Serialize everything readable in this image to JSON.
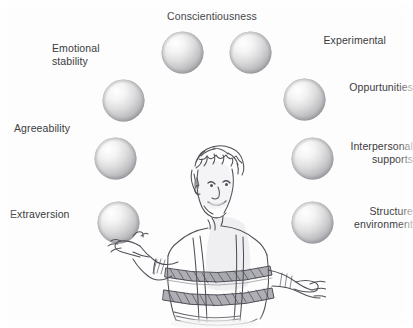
{
  "figure": {
    "canvas": {
      "width": 413,
      "height": 328
    },
    "background_color": "#fdfdfd",
    "text_color": "#3b3b3d",
    "ball_color_light": "#ffffff",
    "ball_color_mid": "#d7d7d9",
    "ball_color_dark": "#9a9a9d",
    "sketch_ink_color": "#4a4a52"
  },
  "labels": {
    "conscientiousness": "Conscientiousness",
    "experimental": "Experimental",
    "opportunities": "Oppurtunities",
    "interpersonal_supports": "Interpersonal\nsupports",
    "structure_environment": "Structure\nenvironment",
    "emotional_stability": "Emotional\nstability",
    "agreeability": "Agreeability",
    "extraversion": "Extraversion"
  },
  "balls": [
    {
      "name": "ball-conscientiousness",
      "x": 161,
      "y": 31,
      "d": 43
    },
    {
      "name": "ball-experimental",
      "x": 229,
      "y": 31,
      "d": 43
    },
    {
      "name": "ball-emotional-stability",
      "x": 102,
      "y": 79,
      "d": 43
    },
    {
      "name": "ball-opportunities",
      "x": 283,
      "y": 78,
      "d": 43
    },
    {
      "name": "ball-agreeability",
      "x": 94,
      "y": 137,
      "d": 43
    },
    {
      "name": "ball-interpersonal-supports",
      "x": 291,
      "y": 137,
      "d": 43
    },
    {
      "name": "ball-extraversion",
      "x": 97,
      "y": 201,
      "d": 43
    },
    {
      "name": "ball-structure-environment",
      "x": 291,
      "y": 201,
      "d": 43
    }
  ],
  "sketch": {
    "subject": "person-juggling-sketch",
    "description": "Pencil sketch of a smiling person with curly hair wearing a striped shirt with suspenders, arms outstretched as if juggling"
  }
}
